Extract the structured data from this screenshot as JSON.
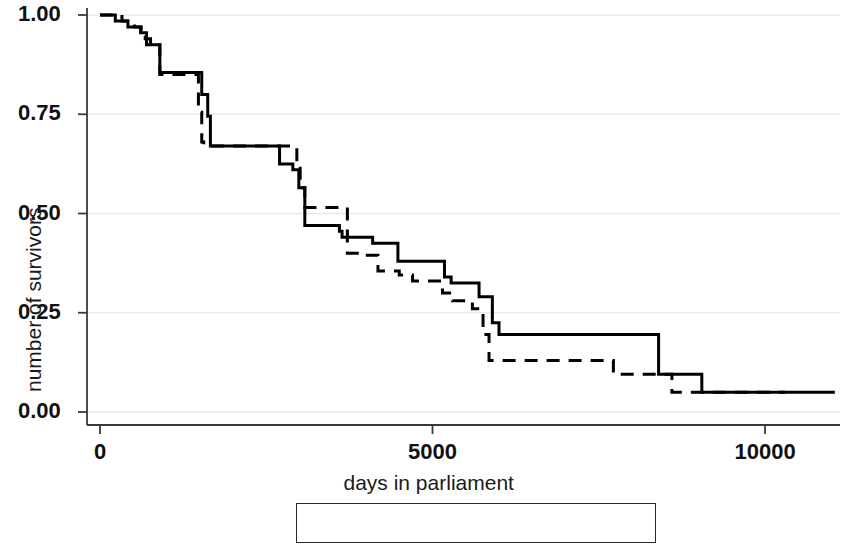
{
  "chart_data": {
    "type": "line",
    "subtype": "kaplan-meier-step",
    "title": "",
    "xlabel": "days in parliament",
    "ylabel": "number of survivors",
    "xlim": [
      0,
      11200
    ],
    "ylim": [
      0.0,
      1.02
    ],
    "xticks": [
      0,
      5000,
      10000
    ],
    "xtick_labels": [
      "0",
      "5000",
      "10000"
    ],
    "yticks": [
      0.0,
      0.25,
      0.5,
      0.75,
      1.0
    ],
    "ytick_labels": [
      "0.00",
      "0.25",
      "0.50",
      "0.75",
      "1.00"
    ],
    "grid": "horizontal-faint",
    "legend_position": "below-center",
    "step_shape": "post",
    "series": [
      {
        "name": "female",
        "style": "solid",
        "color": "#000000",
        "x": [
          0,
          100,
          230,
          330,
          420,
          520,
          610,
          700,
          760,
          830,
          900,
          1430,
          1530,
          1600,
          1620,
          1660,
          2250,
          2700,
          2820,
          2900,
          2930,
          2990,
          3080,
          3400,
          3600,
          3640,
          4030,
          4100,
          4380,
          4480,
          4600,
          5180,
          5280,
          5600,
          5700,
          5820,
          5900,
          6000,
          8150,
          8250,
          8400,
          8980,
          9050,
          11050
        ],
        "y": [
          1.0,
          1.0,
          0.985,
          0.985,
          0.97,
          0.97,
          0.955,
          0.94,
          0.925,
          0.925,
          0.855,
          0.855,
          0.8,
          0.8,
          0.745,
          0.67,
          0.67,
          0.625,
          0.625,
          0.61,
          0.61,
          0.565,
          0.47,
          0.47,
          0.455,
          0.44,
          0.44,
          0.425,
          0.425,
          0.38,
          0.38,
          0.34,
          0.325,
          0.325,
          0.29,
          0.29,
          0.225,
          0.195,
          0.195,
          0.195,
          0.095,
          0.095,
          0.05,
          0.05
        ]
      },
      {
        "name": "male",
        "style": "dashed",
        "color": "#000000",
        "x": [
          0,
          160,
          330,
          430,
          520,
          620,
          680,
          700,
          760,
          830,
          900,
          1430,
          1480,
          1530,
          1560,
          2900,
          2960,
          3010,
          3080,
          3140,
          3400,
          3560,
          3720,
          3900,
          4180,
          4500,
          4700,
          5150,
          5300,
          5600,
          5680,
          5760,
          5850,
          7540,
          7640,
          7720,
          8520,
          8600,
          10300
        ],
        "y": [
          1.0,
          1.0,
          0.985,
          0.985,
          0.97,
          0.955,
          0.94,
          0.925,
          0.925,
          0.925,
          0.85,
          0.85,
          0.755,
          0.68,
          0.67,
          0.67,
          0.63,
          0.565,
          0.515,
          0.515,
          0.515,
          0.515,
          0.4,
          0.395,
          0.355,
          0.345,
          0.33,
          0.3,
          0.28,
          0.26,
          0.26,
          0.195,
          0.13,
          0.13,
          0.13,
          0.095,
          0.095,
          0.05,
          0.05
        ]
      }
    ]
  },
  "legend": {
    "items": [
      {
        "label": "female",
        "style": "solid"
      },
      {
        "label": "male",
        "style": "dashed"
      }
    ]
  }
}
